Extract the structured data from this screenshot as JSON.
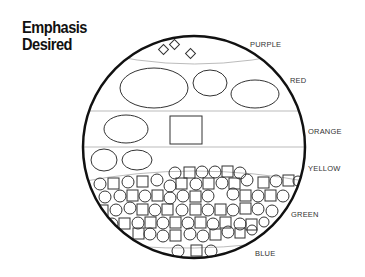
{
  "title": {
    "line1": "Emphasis",
    "line2": "Desired"
  },
  "labels": {
    "purple": "PURPLE",
    "red": "RED",
    "orange": "ORANGE",
    "yellow": "YELLOW",
    "green": "GREEN",
    "blue": "BLUE"
  },
  "sections": [
    {
      "name": "PURPLE",
      "shapes": "3 small diamonds"
    },
    {
      "name": "RED",
      "shapes": "1 large ellipse, 1 medium ellipse, 1 medium ellipse"
    },
    {
      "name": "ORANGE",
      "shapes": "1 ellipse, 1 square"
    },
    {
      "name": "YELLOW",
      "shapes": "2 small ellipses"
    },
    {
      "name": "GREEN",
      "shapes": "many small circles and squares"
    },
    {
      "name": "BLUE",
      "shapes": "circle, square, circle"
    }
  ],
  "colors": {
    "stroke": "#111111",
    "divider": "#aaaaaa",
    "text": "#333333"
  }
}
